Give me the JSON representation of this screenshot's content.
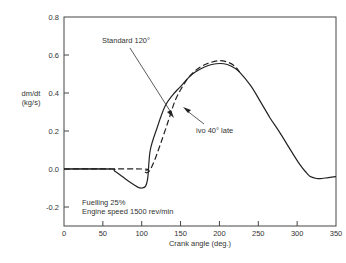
{
  "chart_data": {
    "type": "line",
    "title": "",
    "xlabel": "Crank angle (deg.)",
    "ylabel": "dm/dt",
    "ylabel_units": "(kg/s)",
    "xlim": [
      0,
      350
    ],
    "ylim": [
      -0.29,
      0.8
    ],
    "grid": false,
    "x_ticks": [
      0,
      50,
      100,
      150,
      200,
      250,
      300,
      350
    ],
    "x_tick_labels": [
      "0",
      "50",
      "100",
      "150",
      "200",
      "250",
      "300",
      "350"
    ],
    "y_ticks": [
      0.8,
      0.6,
      0.4,
      0.2,
      0.0,
      -0.2
    ],
    "y_tick_labels": [
      "0.8",
      "0.6",
      "0.4",
      "0.2",
      "0.0",
      "-0.2"
    ],
    "series": [
      {
        "name": "Standard 120°",
        "style": "solid",
        "x": [
          0,
          60,
          65,
          75,
          85,
          95,
          100,
          105,
          108,
          111,
          120,
          130,
          140,
          149,
          160,
          169,
          180,
          190,
          201,
          210,
          220,
          226,
          240,
          252,
          265,
          278,
          290,
          304,
          312,
          317,
          325,
          332,
          340,
          350
        ],
        "y": [
          0.0,
          0.0,
          -0.01,
          -0.04,
          -0.07,
          -0.095,
          -0.1,
          -0.09,
          -0.04,
          0.1,
          0.22,
          0.33,
          0.39,
          0.43,
          0.48,
          0.51,
          0.535,
          0.55,
          0.555,
          0.55,
          0.53,
          0.51,
          0.44,
          0.36,
          0.27,
          0.19,
          0.11,
          0.02,
          -0.02,
          -0.04,
          -0.05,
          -0.05,
          -0.045,
          -0.04
        ]
      },
      {
        "name": "ivo 40° late",
        "style": "dashed",
        "x": [
          0,
          100,
          103,
          106,
          110,
          116,
          124,
          134,
          143,
          152,
          162,
          175,
          188,
          201,
          212,
          220,
          226
        ],
        "y": [
          0.0,
          0.0,
          -0.01,
          -0.02,
          -0.01,
          0.04,
          0.13,
          0.25,
          0.36,
          0.43,
          0.49,
          0.535,
          0.56,
          0.57,
          0.56,
          0.54,
          0.51
        ]
      }
    ],
    "annotations": [
      {
        "text": "Standard 120°",
        "x": 49,
        "y": 0.67,
        "arrow_to": [
          140,
          0.28
        ]
      },
      {
        "text": "ivo 40° late",
        "x": 170,
        "y": 0.2,
        "arrow_to": [
          153,
          0.33
        ]
      },
      {
        "text": "Fuelling 25%",
        "x": 12,
        "y": -0.19
      },
      {
        "text": "Engine speed 1500 rev/min",
        "x": 12,
        "y": -0.24
      }
    ],
    "legend": "none (inline annotations)"
  },
  "labels": {
    "ylabel_line1": "dm/dt",
    "ylabel_line2": "(kg/s)",
    "xlabel": "Crank angle (deg.)",
    "standard": "Standard 120°",
    "ivo": "ivo 40° late",
    "fuelling": "Fuelling 25%",
    "engine_speed": "Engine speed 1500 rev/min"
  }
}
